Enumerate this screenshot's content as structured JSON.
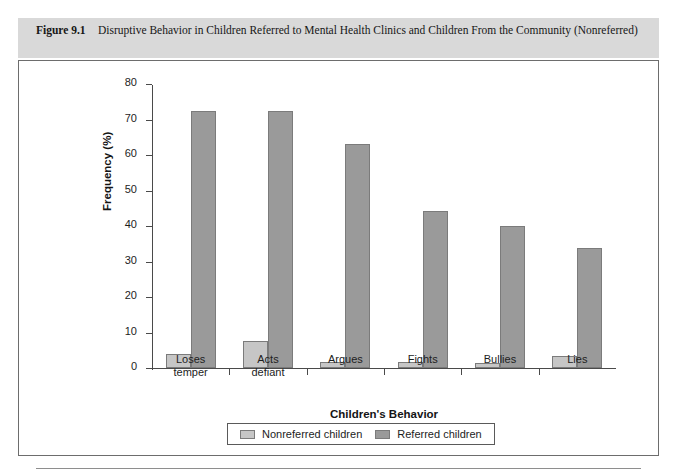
{
  "figure": {
    "label": "Figure 9.1",
    "caption": "Disruptive Behavior in Children Referred to Mental Health Clinics and Children From the Community (Nonreferred)"
  },
  "colors": {
    "caption_band": "#d9d9d9",
    "panel_background": "#ffffff",
    "panel_border": "#6d6d6d",
    "nonreferred": "#c6c6c6",
    "referred": "#9a9a9a",
    "bar_outline": "#7b7b7b",
    "axis": "#4a4a4a"
  },
  "chart_data": {
    "type": "bar",
    "title": "",
    "xlabel": "Children's Behavior",
    "ylabel": "Frequency (%)",
    "ylim": [
      0,
      80
    ],
    "yticks": [
      0,
      10,
      20,
      30,
      40,
      50,
      60,
      70,
      80
    ],
    "grid": false,
    "legend_position": "bottom",
    "categories": [
      "Loses temper",
      "Acts defiant",
      "Argues",
      "Fights",
      "Bullies",
      "Lies"
    ],
    "category_lines": [
      [
        "Loses",
        "temper"
      ],
      [
        "Acts",
        "defiant"
      ],
      [
        "Argues",
        ""
      ],
      [
        "Fights",
        ""
      ],
      [
        "Bullies",
        ""
      ],
      [
        "Lies",
        ""
      ]
    ],
    "series": [
      {
        "name": "Nonreferred children",
        "color": "#c6c6c6",
        "values": [
          4.0,
          7.7,
          1.8,
          1.7,
          1.5,
          3.5
        ]
      },
      {
        "name": "Referred children",
        "color": "#9a9a9a",
        "values": [
          72.5,
          72.5,
          63.0,
          44.3,
          40.0,
          33.8
        ]
      }
    ]
  },
  "legend": {
    "items": [
      {
        "label": "Nonreferred children",
        "swatch": "nonreferred"
      },
      {
        "label": "Referred children",
        "swatch": "referred"
      }
    ]
  }
}
